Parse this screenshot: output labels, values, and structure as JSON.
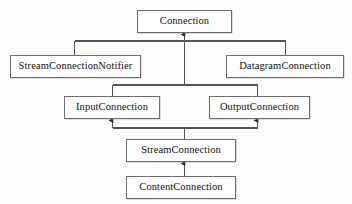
{
  "diagram": {
    "type": "uml-class-inheritance",
    "canvas": {
      "width": 352,
      "height": 204
    },
    "style": {
      "background_color": "#fdfdfb",
      "node_fill": "#ffffff",
      "node_border_color": "#6e6e6e",
      "edge_color": "#555555",
      "text_color": "#111111",
      "arrowhead": "solid-triangle",
      "arrow_direction": "points-to-superclass"
    },
    "nodes": [
      {
        "id": "connection",
        "label": "Connection",
        "x": 137,
        "y": 10,
        "w": 95,
        "h": 23,
        "tier": 0
      },
      {
        "id": "stream_connection_notifier",
        "label": "StreamConnectionNotifier",
        "x": 10,
        "y": 55,
        "w": 131,
        "h": 23,
        "tier": 1
      },
      {
        "id": "datagram_connection",
        "label": "DatagramConnection",
        "x": 226,
        "y": 55,
        "w": 118,
        "h": 23,
        "tier": 1
      },
      {
        "id": "input_connection",
        "label": "InputConnection",
        "x": 64,
        "y": 96,
        "w": 96,
        "h": 23,
        "tier": 2
      },
      {
        "id": "output_connection",
        "label": "OutputConnection",
        "x": 209,
        "y": 96,
        "w": 101,
        "h": 23,
        "tier": 2
      },
      {
        "id": "stream_connection",
        "label": "StreamConnection",
        "x": 126,
        "y": 139,
        "w": 110,
        "h": 23,
        "tier": 3
      },
      {
        "id": "content_connection",
        "label": "ContentConnection",
        "x": 126,
        "y": 176,
        "w": 110,
        "h": 23,
        "tier": 4
      }
    ],
    "edges": [
      {
        "from": "stream_connection_notifier",
        "to": "connection",
        "relation": "generalization"
      },
      {
        "from": "datagram_connection",
        "to": "connection",
        "relation": "generalization"
      },
      {
        "from": "input_connection",
        "to": "connection",
        "relation": "generalization"
      },
      {
        "from": "output_connection",
        "to": "connection",
        "relation": "generalization"
      },
      {
        "from": "stream_connection",
        "to": "input_connection",
        "relation": "generalization"
      },
      {
        "from": "stream_connection",
        "to": "output_connection",
        "relation": "generalization"
      },
      {
        "from": "content_connection",
        "to": "stream_connection",
        "relation": "generalization"
      }
    ],
    "bus_lines": [
      {
        "id": "bus-tier1",
        "y": 41,
        "x1": 74,
        "x2": 285
      },
      {
        "id": "bus-tier2",
        "y": 85,
        "x1": 112,
        "x2": 257
      },
      {
        "id": "bus-tier3",
        "y": 128,
        "x1": 112,
        "x2": 257
      }
    ]
  }
}
